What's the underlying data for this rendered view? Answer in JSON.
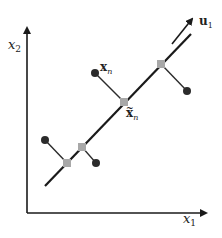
{
  "diagram": {
    "type": "pca-projection",
    "colors": {
      "axis": "#1a1a1a",
      "line": "#1a1a1a",
      "data_point": "#2b2b2b",
      "projected_point": "#a8a8a8",
      "background": "#ffffff"
    },
    "labels": {
      "y_axis": "x",
      "y_axis_sub": "2",
      "x_axis": "x",
      "x_axis_sub": "1",
      "direction": "u",
      "direction_sub": "1",
      "data_point": "x",
      "data_point_sub": "n",
      "projection": "x",
      "projection_sub": "n",
      "projection_accent": "~"
    },
    "points": [
      {
        "name": "xn",
        "data": [
          95,
          73
        ],
        "projection": [
          124,
          102
        ]
      },
      {
        "name": "p2",
        "data": [
          187,
          91
        ],
        "projection": [
          161,
          64
        ]
      },
      {
        "name": "p3",
        "data": [
          45,
          140
        ],
        "projection": [
          67,
          163
        ]
      },
      {
        "name": "p4",
        "data": [
          96,
          163
        ],
        "projection": [
          82,
          147
        ]
      }
    ]
  }
}
